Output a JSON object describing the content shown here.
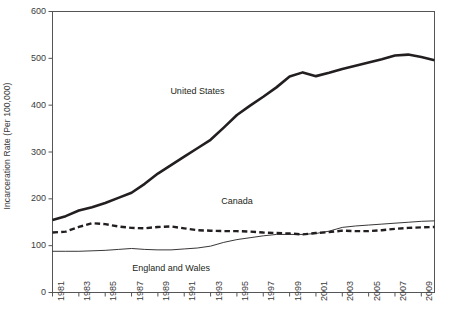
{
  "chart_data": {
    "type": "line",
    "title": "",
    "xlabel": "",
    "ylabel": "Incarceration Rate (Per 100,000)",
    "ylim": [
      0,
      600
    ],
    "yticks": [
      0,
      100,
      200,
      300,
      400,
      500,
      600
    ],
    "xlim": [
      1981,
      2010
    ],
    "xticks": [
      1981,
      1983,
      1985,
      1987,
      1989,
      1991,
      1993,
      1995,
      1997,
      1999,
      2001,
      2003,
      2005,
      2007,
      2009
    ],
    "xtick_labels": [
      "1981",
      "1983",
      "1985",
      "1987",
      "1989",
      "1991",
      "1993",
      "1995",
      "1997",
      "1999",
      "2001",
      "2003",
      "2005",
      "2007",
      "2009"
    ],
    "grid": false,
    "legend": "inline-annotations",
    "x": [
      1981,
      1982,
      1983,
      1984,
      1985,
      1986,
      1987,
      1988,
      1989,
      1990,
      1991,
      1992,
      1993,
      1994,
      1995,
      1996,
      1997,
      1998,
      1999,
      2000,
      2001,
      2002,
      2003,
      2004,
      2005,
      2006,
      2007,
      2008,
      2009,
      2010
    ],
    "series": [
      {
        "name": "United States",
        "style": "solid-thick",
        "color": "#231f20",
        "values": [
          155,
          163,
          175,
          182,
          191,
          202,
          213,
          232,
          254,
          272,
          290,
          308,
          326,
          352,
          379,
          399,
          418,
          438,
          461,
          470,
          462,
          469,
          477,
          484,
          491,
          498,
          506,
          508,
          503,
          496
        ]
      },
      {
        "name": "Canada",
        "style": "dashed",
        "color": "#231f20",
        "values": [
          128,
          130,
          140,
          148,
          146,
          141,
          138,
          137,
          140,
          141,
          137,
          133,
          132,
          131,
          131,
          130,
          128,
          127,
          126,
          124,
          127,
          129,
          132,
          131,
          131,
          133,
          136,
          138,
          139,
          140
        ]
      },
      {
        "name": "England and Wales",
        "style": "solid-thin",
        "color": "#231f20",
        "values": [
          88,
          88,
          88,
          89,
          90,
          92,
          94,
          92,
          91,
          91,
          93,
          95,
          99,
          107,
          113,
          117,
          121,
          124,
          124,
          124,
          126,
          131,
          139,
          142,
          144,
          146,
          148,
          150,
          152,
          153
        ]
      }
    ],
    "annotations": [
      {
        "text": "United States",
        "x": 1992,
        "y": 430
      },
      {
        "text": "Canada",
        "x": 1995,
        "y": 195
      },
      {
        "text": "England and Wales",
        "x": 1990,
        "y": 52
      }
    ]
  }
}
